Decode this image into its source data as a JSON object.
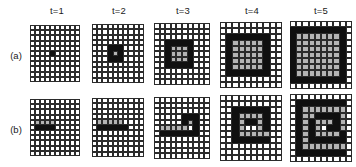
{
  "figure": {
    "row_labels": [
      {
        "id": "a",
        "text": "(a)"
      },
      {
        "id": "b",
        "text": "(b)"
      }
    ],
    "column_headers": [
      {
        "id": "t1",
        "text": "t=1"
      },
      {
        "id": "t2",
        "text": "t=2"
      },
      {
        "id": "t3",
        "text": "t=3"
      },
      {
        "id": "t4",
        "text": "t=4"
      },
      {
        "id": "t5",
        "text": "t=5"
      }
    ],
    "colors": {
      "white": "#ffffff",
      "black": "#101010",
      "gray": "#b4b4b4",
      "gridline": "#2b2b2b",
      "text": "#1a1a1a"
    },
    "legend": {
      "white": "inactive cell",
      "black": "newly activated cell",
      "gray": "previously activated cell"
    }
  },
  "chart_data": {
    "type": "heatmap",
    "title": "",
    "xlabel": "",
    "ylabel": "",
    "cell_states": [
      "white",
      "black",
      "gray"
    ],
    "grid_rows": 11,
    "grid_cols": 10,
    "panels": [
      {
        "row": "a",
        "time": "t=1",
        "time_index": 1,
        "rows": 11,
        "cols": 10,
        "cells": [
          "wwwwwwwwww",
          "wwwwwwwwww",
          "wwwwwwwwww",
          "wwwwwwwwww",
          "wwwwwwwwww",
          "wwwwbwwwww",
          "wwwwwwwwww",
          "wwwwwwwwww",
          "wwwwwwwwww",
          "wwwwwwwwww",
          "wwwwwwwwww"
        ]
      },
      {
        "row": "a",
        "time": "t=2",
        "time_index": 2,
        "rows": 11,
        "cols": 10,
        "cells": [
          "wwwwwwwwww",
          "wwwwwwwwww",
          "wwwwwwwwww",
          "wwwwwwwwww",
          "wwwbbbwwww",
          "wwwbgbwwww",
          "wwwbbbwwww",
          "wwwwwwwwww",
          "wwwwwwwwww",
          "wwwwwwwwww",
          "wwwwwwwwww"
        ]
      },
      {
        "row": "a",
        "time": "t=3",
        "time_index": 3,
        "rows": 11,
        "cols": 10,
        "cells": [
          "wwwwwwwwww",
          "wwwwwwwwww",
          "wwwwwwwwww",
          "wwbbbbbwww",
          "wwbgggbwww",
          "wwbgggbwww",
          "wwbgggbwww",
          "wwbbbbbwww",
          "wwwwwwwwww",
          "wwwwwwwwww",
          "wwwwwwwwww"
        ]
      },
      {
        "row": "a",
        "time": "t=4",
        "time_index": 4,
        "rows": 11,
        "cols": 10,
        "cells": [
          "wwwwwwwwww",
          "wwwwwwwwww",
          "wbbbbbbbww",
          "wbgggggbww",
          "wbgggggbww",
          "wbgggggbww",
          "wbgggggbww",
          "wbgggggbww",
          "wbbbbbbbww",
          "wwwwwwwwww",
          "wwwwwwwwww"
        ]
      },
      {
        "row": "a",
        "time": "t=5",
        "time_index": 5,
        "rows": 11,
        "cols": 10,
        "cells": [
          "wwwwwwwwww",
          "bbbbbbbbbw",
          "bgggggggbw",
          "bgggggggbw",
          "bgggggggbw",
          "bgggggggbw",
          "bgggggggbw",
          "bgggggggbw",
          "bgggggggbw",
          "bbbbbbbbbw",
          "wwwwwwwwww"
        ]
      },
      {
        "row": "b",
        "time": "t=1",
        "time_index": 1,
        "rows": 11,
        "cols": 10,
        "cells": [
          "wwwwwwwwww",
          "wwwwwwwwww",
          "wwwwwwwwww",
          "wwwwwwwwww",
          "wggggwwwww",
          "wbbbbwwwww",
          "wwwwwwwwww",
          "wwwwwwwwww",
          "wwwwwwwwww",
          "wwwwwwwwww",
          "wwwwwwwwww"
        ]
      },
      {
        "row": "b",
        "time": "t=2",
        "time_index": 2,
        "rows": 11,
        "cols": 10,
        "cells": [
          "wwwwwwwwww",
          "wwwwwwwwww",
          "wwwwwwwwww",
          "wwwwwwwwww",
          "wgggggwwww",
          "wbbbbbbwww",
          "wwwwwwwwww",
          "wwwwwwwwww",
          "wwwwwwwwww",
          "wwwwwwwwww",
          "wwwwwwwwww"
        ]
      },
      {
        "row": "b",
        "time": "t=3",
        "time_index": 3,
        "rows": 11,
        "cols": 10,
        "cells": [
          "wwwwwwwwww",
          "wwwwwwwwww",
          "wwwwwwwwww",
          "wwwwwbbbww",
          "wwwwwbgbww",
          "wgggggwbww",
          "wbbbbbbbww",
          "wwwwwwwwww",
          "wwwwwwwwww",
          "wwwwwwwwww",
          "wwwwwwwwww"
        ]
      },
      {
        "row": "b",
        "time": "t=4",
        "time_index": 4,
        "rows": 11,
        "cols": 10,
        "cells": [
          "wwwwwwwwww",
          "wwwwwwwwww",
          "wwbbbbbbww",
          "wwbggggbww",
          "wwbgbbgbww",
          "wwbgwwgbww",
          "wwbgggggww",
          "wwbbbbbbww",
          "wwwwwwwwww",
          "wwwwwwwwww",
          "wwwwwwwwww"
        ]
      },
      {
        "row": "b",
        "time": "t=5",
        "time_index": 5,
        "rows": 11,
        "cols": 10,
        "cells": [
          "wwwwwwwwww",
          "wbbbbbbbbw",
          "wbgggggggw",
          "wbggbbbbgw",
          "wbgbgggbgw",
          "wbgbgwbbgw",
          "wbgbggggbw",
          "wbgbbbbbbw",
          "wbgggggggw",
          "wbbbbbbbbw",
          "wwwwwwwwww"
        ]
      }
    ]
  }
}
